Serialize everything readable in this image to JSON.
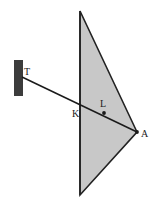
{
  "figure": {
    "background_color": "#ffffff",
    "width": 153,
    "height": 217,
    "labels": {
      "T": "T",
      "K": "K",
      "L": "L",
      "A": "A"
    },
    "colors": {
      "shade_fill": "#c8c8c8",
      "shade_stroke": "#222222",
      "ray_stroke": "#1a1a1a",
      "block_fill": "#3c3c3c",
      "label_color": "#1a1a1a"
    },
    "shapes": {
      "shaded_triangle": {
        "name": "shaded-triangle",
        "points": [
          [
            80,
            11
          ],
          [
            137,
            132
          ],
          [
            80,
            195
          ]
        ],
        "fill": "#c8c8c8",
        "stroke": "#222222",
        "stroke_width": 1.6
      },
      "vertical_edge": {
        "name": "vertical-edge",
        "from": [
          80,
          11
        ],
        "to": [
          80,
          195
        ]
      },
      "dark_block": {
        "name": "dark-block",
        "x": 14,
        "y": 60,
        "width": 9,
        "height": 36,
        "fill": "#3c3c3c"
      },
      "ray_TA": {
        "name": "ray-t-to-a",
        "from": [
          22,
          77
        ],
        "to": [
          137,
          132
        ],
        "stroke_width": 1.5
      },
      "point_L": {
        "name": "point-l",
        "cx": 104,
        "cy": 113,
        "r": 1.9
      },
      "point_A": {
        "name": "point-a",
        "cx": 137,
        "cy": 132,
        "r": 1.9
      }
    }
  }
}
